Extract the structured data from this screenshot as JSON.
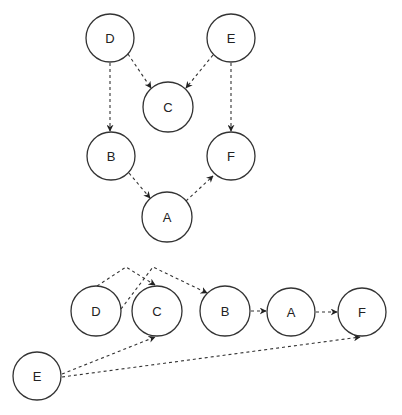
{
  "diagram": {
    "type": "directed-graph",
    "edge_style": "dashed",
    "colors": {
      "background": "#ffffff",
      "stroke": "#333333",
      "text": "#222222"
    },
    "graphs": [
      {
        "name": "top-graph",
        "layout": "layered",
        "nodes": [
          {
            "id": "D",
            "label": "D",
            "x": 110,
            "y": 38,
            "r": 24
          },
          {
            "id": "E",
            "label": "E",
            "x": 231,
            "y": 38,
            "r": 24
          },
          {
            "id": "C",
            "label": "C",
            "x": 168,
            "y": 107,
            "r": 25
          },
          {
            "id": "B",
            "label": "B",
            "x": 111,
            "y": 156,
            "r": 24
          },
          {
            "id": "F",
            "label": "F",
            "x": 231,
            "y": 156,
            "r": 24
          },
          {
            "id": "A",
            "label": "A",
            "x": 167,
            "y": 217,
            "r": 25
          }
        ],
        "edges": [
          {
            "from": "D",
            "to": "C"
          },
          {
            "from": "E",
            "to": "C"
          },
          {
            "from": "D",
            "to": "B"
          },
          {
            "from": "E",
            "to": "F"
          },
          {
            "from": "B",
            "to": "A"
          },
          {
            "from": "A",
            "to": "F"
          }
        ]
      },
      {
        "name": "bottom-graph",
        "layout": "linear",
        "nodes": [
          {
            "id": "D",
            "label": "D",
            "x": 96,
            "y": 311,
            "r": 25
          },
          {
            "id": "C",
            "label": "C",
            "x": 157,
            "y": 311,
            "r": 25
          },
          {
            "id": "B",
            "label": "B",
            "x": 225,
            "y": 311,
            "r": 25
          },
          {
            "id": "A",
            "label": "A",
            "x": 291,
            "y": 312,
            "r": 24
          },
          {
            "id": "F",
            "label": "F",
            "x": 362,
            "y": 312,
            "r": 24
          },
          {
            "id": "E",
            "label": "E",
            "x": 37,
            "y": 376,
            "r": 24
          }
        ],
        "edges": [
          {
            "from": "D",
            "to": "C"
          },
          {
            "from": "D",
            "to": "B"
          },
          {
            "from": "B",
            "to": "A"
          },
          {
            "from": "A",
            "to": "F"
          },
          {
            "from": "E",
            "to": "C"
          },
          {
            "from": "E",
            "to": "F"
          }
        ]
      }
    ]
  }
}
